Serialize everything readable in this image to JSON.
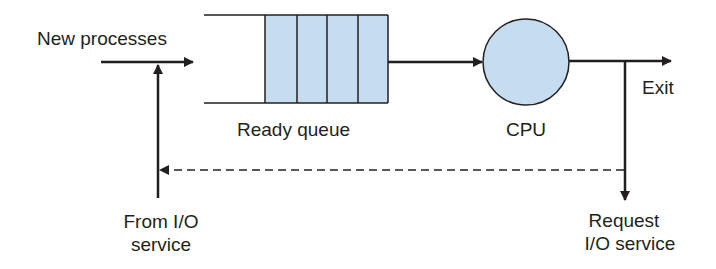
{
  "diagram": {
    "type": "process-scheduling-queue",
    "colors": {
      "stroke": "#231f20",
      "fill": "#c6dcf0",
      "background": "#ffffff"
    },
    "labels": {
      "new_processes": "New processes",
      "ready_queue": "Ready queue",
      "cpu": "CPU",
      "exit": "Exit",
      "from_io_line1": "From I/O",
      "from_io_line2": "service",
      "request_io_line1": "Request",
      "request_io_line2": "I/O service"
    },
    "queue": {
      "slots": 4
    },
    "edges": [
      {
        "from": "New processes",
        "to": "Ready queue",
        "style": "solid"
      },
      {
        "from": "From I/O service",
        "to": "Ready queue",
        "style": "solid"
      },
      {
        "from": "Ready queue",
        "to": "CPU",
        "style": "solid"
      },
      {
        "from": "CPU",
        "to": "Exit",
        "style": "solid"
      },
      {
        "from": "CPU",
        "to": "Request I/O service",
        "style": "solid"
      },
      {
        "from": "Request I/O service",
        "to": "From I/O service",
        "style": "dashed"
      }
    ]
  }
}
